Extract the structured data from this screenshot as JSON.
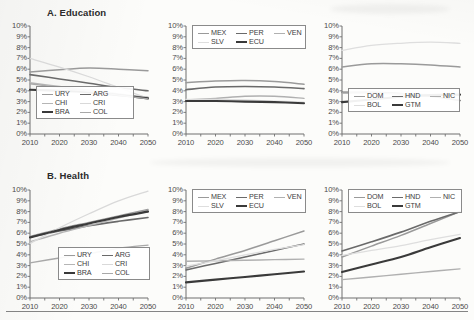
{
  "figure": {
    "sections": [
      {
        "id": "education",
        "title": "A. Education"
      },
      {
        "id": "health",
        "title": "B. Health"
      }
    ]
  },
  "axis": {
    "y_ticks": [
      "10%",
      "9%",
      "8%",
      "7%",
      "6%",
      "5%",
      "4%",
      "3%",
      "2%",
      "1%",
      "0%"
    ],
    "x_ticks": [
      "2010",
      "2020",
      "2030",
      "2040",
      "2050"
    ],
    "ylim": [
      0,
      10
    ],
    "xlim": [
      2010,
      2050
    ],
    "grid": false
  },
  "colors": {
    "ink": "#3b3b3b",
    "axis": "#6f6f6f",
    "URY": "#9a9a9a",
    "ARG": "#6a6a6a",
    "CHI": "#b5b5b5",
    "CRI": "#d9d9d9",
    "BRA": "#3a3a3a",
    "COL": "#a8a8a8",
    "MEX": "#9a9a9a",
    "PER": "#6a6a6a",
    "VEN": "#b0b0b0",
    "SLV": "#dedede",
    "ECU": "#3a3a3a",
    "DOM": "#9a9a9a",
    "HND": "#6a6a6a",
    "NIC": "#b0b0b0",
    "BOL": "#dedede",
    "GTM": "#3a3a3a"
  },
  "chart_data": [
    {
      "type": "line",
      "panel": 1,
      "section": "A. Education",
      "title": "A. Education",
      "xlabel": "",
      "ylabel": "",
      "x": [
        2010,
        2020,
        2030,
        2040,
        2050
      ],
      "xlim": [
        2010,
        2050
      ],
      "ylim": [
        0,
        10
      ],
      "grid": false,
      "legend_position": "bottom-left",
      "series": [
        {
          "name": "URY",
          "values": [
            5.75,
            5.95,
            6.1,
            6.0,
            5.85
          ]
        },
        {
          "name": "ARG",
          "values": [
            5.5,
            5.1,
            4.7,
            4.3,
            4.0
          ]
        },
        {
          "name": "CHI",
          "values": [
            4.75,
            4.4,
            4.05,
            3.7,
            3.4
          ]
        },
        {
          "name": "CRI",
          "values": [
            7.0,
            6.2,
            5.3,
            4.3,
            3.3
          ]
        },
        {
          "name": "BRA",
          "values": [
            4.1,
            4.0,
            3.85,
            3.6,
            3.3
          ]
        },
        {
          "name": "COL",
          "values": [
            4.65,
            4.3,
            3.95,
            3.6,
            3.25
          ]
        }
      ]
    },
    {
      "type": "line",
      "panel": 2,
      "section": "A. Education",
      "title": "",
      "xlabel": "",
      "ylabel": "",
      "x": [
        2010,
        2020,
        2030,
        2040,
        2050
      ],
      "xlim": [
        2010,
        2050
      ],
      "ylim": [
        0,
        10
      ],
      "grid": false,
      "legend_position": "top",
      "series": [
        {
          "name": "MEX",
          "values": [
            4.75,
            4.9,
            4.95,
            4.85,
            4.6
          ]
        },
        {
          "name": "PER",
          "values": [
            4.1,
            4.35,
            4.4,
            4.35,
            4.2
          ]
        },
        {
          "name": "VEN",
          "values": [
            3.15,
            3.3,
            3.5,
            3.5,
            3.3
          ]
        },
        {
          "name": "SLV",
          "values": [
            3.2,
            3.2,
            3.15,
            3.05,
            2.95
          ]
        },
        {
          "name": "ECU",
          "values": [
            3.05,
            3.05,
            3.0,
            2.95,
            2.85
          ]
        }
      ]
    },
    {
      "type": "line",
      "panel": 3,
      "section": "A. Education",
      "title": "",
      "xlabel": "",
      "ylabel": "",
      "x": [
        2010,
        2020,
        2030,
        2040,
        2050
      ],
      "xlim": [
        2010,
        2050
      ],
      "ylim": [
        0,
        10
      ],
      "grid": false,
      "legend_position": "bottom-left",
      "series": [
        {
          "name": "DOM",
          "values": [
            6.2,
            6.5,
            6.5,
            6.4,
            6.2
          ]
        },
        {
          "name": "HND",
          "values": [
            3.85,
            3.85,
            3.75,
            3.5,
            3.1
          ]
        },
        {
          "name": "NIC",
          "values": [
            3.8,
            3.8,
            3.7,
            3.65,
            3.6
          ]
        },
        {
          "name": "BOL",
          "values": [
            7.75,
            8.2,
            8.4,
            8.5,
            8.4
          ]
        },
        {
          "name": "GTM",
          "values": [
            2.95,
            3.2,
            3.45,
            3.6,
            3.65
          ]
        }
      ]
    },
    {
      "type": "line",
      "panel": 4,
      "section": "B. Health",
      "title": "B. Health",
      "xlabel": "",
      "ylabel": "",
      "x": [
        2010,
        2020,
        2030,
        2040,
        2050
      ],
      "xlim": [
        2010,
        2050
      ],
      "ylim": [
        0,
        10
      ],
      "grid": false,
      "legend_position": "bottom-right",
      "series": [
        {
          "name": "URY",
          "values": [
            5.7,
            6.4,
            7.0,
            7.6,
            8.2
          ]
        },
        {
          "name": "ARG",
          "values": [
            5.65,
            6.2,
            6.7,
            7.1,
            7.45
          ]
        },
        {
          "name": "CHI",
          "values": [
            5.2,
            6.0,
            6.7,
            7.4,
            8.1
          ]
        },
        {
          "name": "CRI",
          "values": [
            5.05,
            6.5,
            7.8,
            9.0,
            9.9
          ]
        },
        {
          "name": "BRA",
          "values": [
            5.6,
            6.3,
            6.9,
            7.5,
            8.0
          ]
        },
        {
          "name": "COL",
          "values": [
            3.25,
            3.7,
            4.1,
            4.6,
            4.9
          ]
        }
      ]
    },
    {
      "type": "line",
      "panel": 5,
      "section": "B. Health",
      "title": "",
      "xlabel": "",
      "ylabel": "",
      "x": [
        2010,
        2020,
        2030,
        2040,
        2050
      ],
      "xlim": [
        2010,
        2050
      ],
      "ylim": [
        0,
        10
      ],
      "grid": false,
      "legend_position": "top",
      "series": [
        {
          "name": "MEX",
          "values": [
            2.75,
            3.6,
            4.4,
            5.3,
            6.2
          ]
        },
        {
          "name": "PER",
          "values": [
            2.6,
            3.2,
            3.8,
            4.4,
            5.0
          ]
        },
        {
          "name": "VEN",
          "values": [
            3.4,
            3.45,
            3.5,
            3.55,
            3.6
          ]
        },
        {
          "name": "SLV",
          "values": [
            2.95,
            3.45,
            4.0,
            4.5,
            4.95
          ]
        },
        {
          "name": "ECU",
          "values": [
            1.45,
            1.7,
            1.95,
            2.2,
            2.45
          ]
        }
      ]
    },
    {
      "type": "line",
      "panel": 6,
      "section": "B. Health",
      "title": "",
      "xlabel": "",
      "ylabel": "",
      "x": [
        2010,
        2020,
        2030,
        2040,
        2050
      ],
      "xlim": [
        2010,
        2050
      ],
      "ylim": [
        0,
        10
      ],
      "grid": false,
      "legend_position": "top",
      "series": [
        {
          "name": "DOM",
          "values": [
            3.8,
            4.8,
            5.8,
            6.9,
            8.0
          ]
        },
        {
          "name": "HND",
          "values": [
            4.35,
            5.2,
            6.1,
            7.1,
            8.0
          ]
        },
        {
          "name": "NIC",
          "values": [
            1.7,
            1.95,
            2.2,
            2.45,
            2.7
          ]
        },
        {
          "name": "BOL",
          "values": [
            3.95,
            4.4,
            4.85,
            5.4,
            5.9
          ]
        },
        {
          "name": "GTM",
          "values": [
            2.4,
            3.1,
            3.8,
            4.7,
            5.55
          ]
        }
      ]
    }
  ],
  "legends": [
    {
      "panel": 1,
      "rows": [
        [
          "URY",
          "ARG"
        ],
        [
          "CHI",
          "CRI"
        ],
        [
          "BRA",
          "COL"
        ]
      ]
    },
    {
      "panel": 2,
      "rows": [
        [
          "MEX",
          "PER",
          "VEN"
        ],
        [
          "SLV",
          "ECU"
        ]
      ]
    },
    {
      "panel": 3,
      "rows": [
        [
          "DOM",
          "HND",
          "NIC"
        ],
        [
          "BOL",
          "GTM"
        ]
      ]
    },
    {
      "panel": 4,
      "rows": [
        [
          "URY",
          "ARG"
        ],
        [
          "CHI",
          "CRI"
        ],
        [
          "BRA",
          "COL"
        ]
      ]
    },
    {
      "panel": 5,
      "rows": [
        [
          "MEX",
          "PER",
          "VEN"
        ],
        [
          "SLV",
          "ECU"
        ]
      ]
    },
    {
      "panel": 6,
      "rows": [
        [
          "DOM",
          "HND",
          "NIC"
        ],
        [
          "BOL",
          "GTM"
        ]
      ]
    }
  ]
}
